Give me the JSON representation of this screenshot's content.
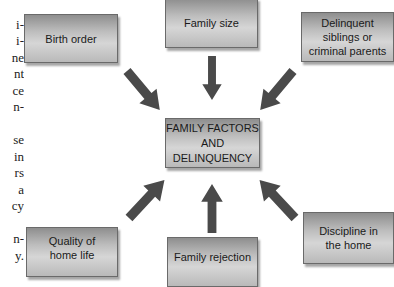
{
  "margin_text": {
    "lines": [
      "",
      "i-",
      "i-",
      "ne",
      "nt",
      "ce",
      "n-",
      "",
      "se",
      "in",
      "rs",
      "a",
      "cy",
      "",
      "n-",
      "y."
    ]
  },
  "diagram": {
    "center": {
      "label_lines": [
        "FAMILY FACTORS",
        "AND",
        "DELINQUENCY"
      ]
    },
    "factors": [
      {
        "id": "birth-order",
        "label_lines": [
          "Birth order"
        ]
      },
      {
        "id": "family-size",
        "label_lines": [
          "Family size"
        ]
      },
      {
        "id": "delinquent-siblings",
        "label_lines": [
          "Delinquent",
          "siblings or",
          "criminal parents"
        ]
      },
      {
        "id": "quality-home-life",
        "label_lines": [
          "Quality of",
          "home life"
        ]
      },
      {
        "id": "family-rejection",
        "label_lines": [
          "Family rejection"
        ]
      },
      {
        "id": "discipline-home",
        "label_lines": [
          "Discipline in",
          "the home"
        ]
      }
    ],
    "colors": {
      "arrow": "#4a4a4a",
      "box_border": "#6a6a6a",
      "box_gradient_dark": "#8e8e8e",
      "box_gradient_light": "#d6d6d6"
    }
  }
}
